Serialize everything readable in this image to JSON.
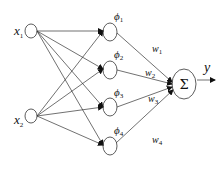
{
  "diagram": {
    "type": "rbf-neural-network",
    "inputs": [
      {
        "id": "x1",
        "symbol": "x",
        "subscript": "1"
      },
      {
        "id": "x2",
        "symbol": "x",
        "subscript": "2"
      }
    ],
    "hidden": [
      {
        "id": "phi1",
        "symbol": "ϕ",
        "subscript": "1"
      },
      {
        "id": "phi2",
        "symbol": "ϕ",
        "subscript": "2"
      },
      {
        "id": "phi3",
        "symbol": "ϕ",
        "subscript": "3"
      },
      {
        "id": "phi4",
        "symbol": "ϕ",
        "subscript": "4"
      }
    ],
    "weights": [
      {
        "id": "w1",
        "symbol": "w",
        "subscript": "1"
      },
      {
        "id": "w2",
        "symbol": "w",
        "subscript": "2"
      },
      {
        "id": "w3",
        "symbol": "w",
        "subscript": "3"
      },
      {
        "id": "w4",
        "symbol": "w",
        "subscript": "4"
      }
    ],
    "sum_node": {
      "symbol": "Σ"
    },
    "output": {
      "symbol": "y"
    },
    "colors": {
      "stroke": "#333333",
      "text": "#111111",
      "background": "#ffffff"
    }
  }
}
